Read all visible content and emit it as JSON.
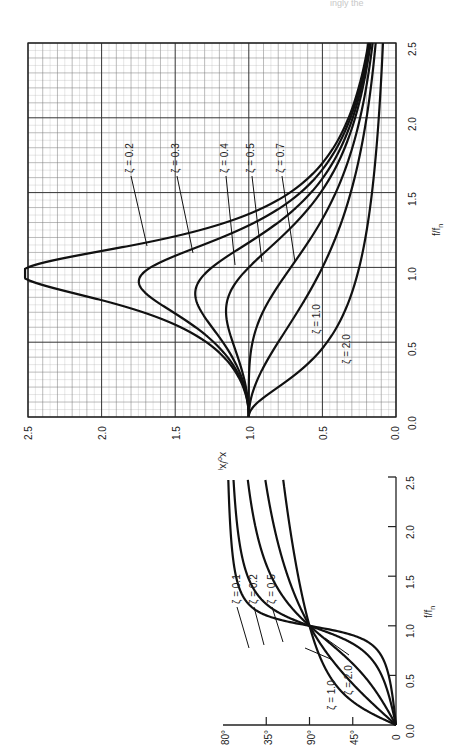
{
  "header_fragment": "ingly the",
  "chart_data": [
    {
      "id": "amplitude-ratio",
      "type": "line",
      "orientation": "rotated-90-ccw",
      "title": "",
      "xlabel": "f/f_n",
      "ylabel": "x_o/x_i",
      "xlim": [
        0.0,
        2.5
      ],
      "ylim": [
        0.0,
        2.5
      ],
      "x_ticks": [
        "0.0",
        "0.5",
        "1.0",
        "1.5",
        "2.0",
        "2.5"
      ],
      "y_ticks": [
        "0.0",
        "0.5",
        "1.0",
        "1.5",
        "2.0",
        "2.5"
      ],
      "grid": true,
      "legend": "inline labels",
      "series": [
        {
          "name": "ζ = 0.2",
          "zeta": 0.2,
          "x": [
            0,
            0.5,
            0.8,
            0.9,
            0.96,
            1.0,
            1.1,
            1.3,
            1.5,
            2.0,
            2.5
          ],
          "values": [
            1.0,
            1.29,
            2.02,
            2.43,
            2.54,
            2.5,
            1.86,
            1.02,
            0.7,
            0.32,
            0.19
          ]
        },
        {
          "name": "ζ = 0.3",
          "zeta": 0.3,
          "x": [
            0,
            0.5,
            0.8,
            0.9,
            1.0,
            1.1,
            1.3,
            1.5,
            2.0,
            2.5
          ],
          "values": [
            1.0,
            1.22,
            1.62,
            1.73,
            1.67,
            1.4,
            0.9,
            0.64,
            0.31,
            0.19
          ]
        },
        {
          "name": "ζ = 0.4",
          "zeta": 0.4,
          "x": [
            0,
            0.5,
            0.8,
            1.0,
            1.2,
            1.5,
            2.0,
            2.5
          ],
          "values": [
            1.0,
            1.15,
            1.32,
            1.25,
            0.92,
            0.58,
            0.3,
            0.18
          ]
        },
        {
          "name": "ζ = 0.5",
          "zeta": 0.5,
          "x": [
            0,
            0.5,
            0.8,
            1.0,
            1.2,
            1.5,
            2.0,
            2.5
          ],
          "values": [
            1.0,
            1.1,
            1.12,
            1.0,
            0.79,
            0.53,
            0.28,
            0.18
          ]
        },
        {
          "name": "ζ = 0.7",
          "zeta": 0.7,
          "x": [
            0,
            0.5,
            0.8,
            1.0,
            1.2,
            1.5,
            2.0,
            2.5
          ],
          "values": [
            1.0,
            0.99,
            0.84,
            0.71,
            0.59,
            0.43,
            0.24,
            0.16
          ]
        },
        {
          "name": "ζ = 1.0",
          "zeta": 1.0,
          "x": [
            0,
            0.5,
            1.0,
            1.5,
            2.0,
            2.5
          ],
          "values": [
            1.0,
            0.8,
            0.5,
            0.31,
            0.2,
            0.14
          ]
        },
        {
          "name": "ζ = 2.0",
          "zeta": 2.0,
          "x": [
            0,
            0.5,
            1.0,
            1.5,
            2.0,
            2.5
          ],
          "values": [
            1.0,
            0.47,
            0.25,
            0.16,
            0.12,
            0.09
          ]
        }
      ]
    },
    {
      "id": "phase-angle",
      "type": "line",
      "orientation": "rotated-90-ccw",
      "title": "",
      "xlabel": "f/f_n",
      "ylabel": "phase",
      "xlim": [
        0.0,
        2.5
      ],
      "ylim": [
        0,
        180
      ],
      "x_ticks": [
        "0.0",
        "0.5",
        "1.0",
        "1.5",
        "2.0",
        "2.5"
      ],
      "y_ticks": [
        "80°",
        "35°",
        "90°",
        "45°",
        "0"
      ],
      "grid": false,
      "legend": "inline labels",
      "series": [
        {
          "name": "ζ = 0.1",
          "zeta": 0.1,
          "x": [
            0,
            0.5,
            1.0,
            1.5,
            2.0,
            2.5
          ],
          "values": [
            0,
            7.6,
            90,
            166.6,
            172.4,
            174.6
          ]
        },
        {
          "name": "ζ = 0.2",
          "zeta": 0.2,
          "x": [
            0,
            0.5,
            1.0,
            1.5,
            2.0,
            2.5
          ],
          "values": [
            0,
            14.9,
            90,
            154.4,
            165.1,
            169.2
          ]
        },
        {
          "name": "ζ = 0.5",
          "zeta": 0.5,
          "x": [
            0,
            0.5,
            1.0,
            1.5,
            2.0,
            2.5
          ],
          "values": [
            0,
            33.7,
            90,
            129.8,
            146.3,
            154.5
          ]
        },
        {
          "name": "ζ = 1.0",
          "zeta": 1.0,
          "x": [
            0,
            0.5,
            1.0,
            1.5,
            2.0,
            2.5
          ],
          "values": [
            0,
            53.1,
            90,
            112.6,
            126.9,
            136.4
          ]
        },
        {
          "name": "ζ = 2.0",
          "zeta": 2.0,
          "x": [
            0,
            0.5,
            1.0,
            1.5,
            2.0,
            2.5
          ],
          "values": [
            0,
            69.4,
            90,
            102.4,
            110.9,
            117.2
          ]
        }
      ]
    }
  ],
  "main": {
    "xlabel": "f/f",
    "xlabel_sub": "n",
    "ylabel": "x",
    "ylabel_full": "xo/xi",
    "ratio_ticks": [
      "2.5",
      "2.0",
      "1.5",
      "1.0",
      "0.5",
      "0.0"
    ],
    "freq_ticks": [
      "0.0",
      "0.5",
      "1.0",
      "1.5",
      "2.0",
      "2.5"
    ],
    "labels": [
      "ζ = 0.2",
      "ζ = 0.3",
      "ζ = 0.4",
      "ζ = 0.5",
      "ζ = 0.7",
      "ζ = 1.0",
      "ζ = 2.0"
    ]
  },
  "phase": {
    "xlabel": "f/f",
    "xlabel_sub": "n",
    "angle_ticks": [
      "80°",
      "35°",
      "90°",
      "45°",
      "0"
    ],
    "freq_ticks": [
      "0.0",
      "0.5",
      "1.0",
      "1.5",
      "2.0",
      "2.5"
    ],
    "labels": [
      "ζ = 0.1",
      "ζ = 0.2",
      "ζ = 0.5",
      "ζ = 1.0",
      "ζ = 2.0"
    ]
  }
}
